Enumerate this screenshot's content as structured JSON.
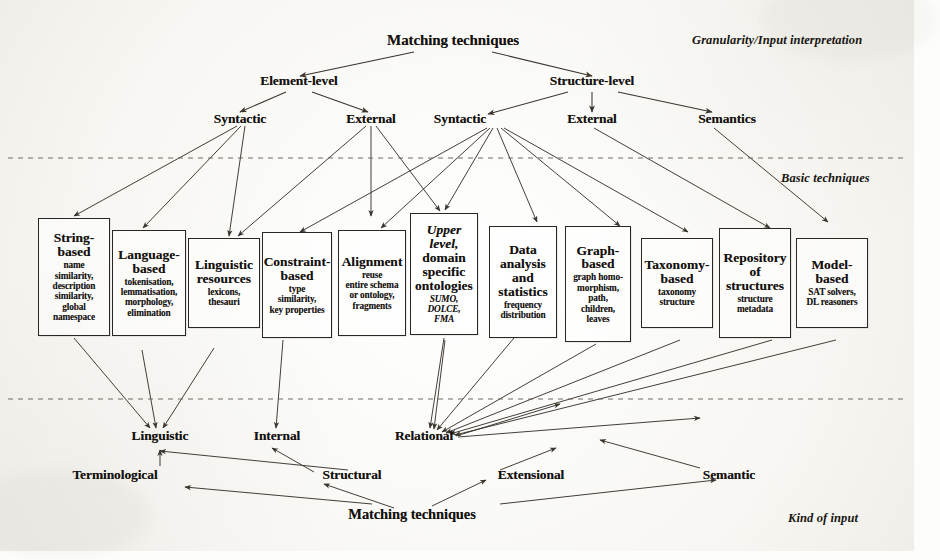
{
  "figure": {
    "root_top": "Matching techniques",
    "root_bottom": "Matching techniques",
    "tier_labels": {
      "granularity": "Granularity/Input interpretation",
      "basic": "Basic techniques",
      "kind": "Kind of input"
    },
    "level2": [
      {
        "label": "Element-level"
      },
      {
        "label": "Structure-level"
      }
    ],
    "level3": [
      {
        "label": "Syntactic"
      },
      {
        "label": "External"
      },
      {
        "label": "Syntactic"
      },
      {
        "label": "External"
      },
      {
        "label": "Semantics"
      }
    ],
    "boxes": [
      {
        "title": "String-\nbased",
        "title_italic": false,
        "sub": "name\nsimilarity,\ndescription\nsimilarity,\nglobal\nnamespace",
        "sub_italic": false
      },
      {
        "title": "Language-\nbased",
        "title_italic": false,
        "sub": "tokenisation,\nlemmatisation,\nmorphology,\nelimination",
        "sub_italic": false
      },
      {
        "title": "Linguistic\nresources",
        "title_italic": false,
        "sub": "lexicons,\nthesauri",
        "sub_italic": false
      },
      {
        "title": "Constraint-\nbased",
        "title_italic": false,
        "sub": "type\nsimilarity,\nkey properties",
        "sub_italic": false
      },
      {
        "title": "Alignment",
        "title_italic": false,
        "sub": "reuse\nentire schema\nor ontology,\nfragments",
        "sub_italic": false
      },
      {
        "title": "Upper\nlevel,",
        "title_italic": true,
        "title2": "domain\nspecific\nontologies",
        "sub": "SUMO,\nDOLCE,\nFMA",
        "sub_italic": true
      },
      {
        "title": "Data\nanalysis\nand\nstatistics",
        "title_italic": false,
        "sub": "frequency\ndistribution",
        "sub_italic": false
      },
      {
        "title": "Graph-\nbased",
        "title_italic": false,
        "sub": "graph homo-\nmorphism,\npath,\nchildren,\nleaves",
        "sub_italic": false
      },
      {
        "title": "Taxonomy-\nbased",
        "title_italic": false,
        "sub": "taxonomy\nstructure",
        "sub_italic": false
      },
      {
        "title": "Repository\nof\nstructures",
        "title_italic": false,
        "sub": "structure\nmetadata",
        "sub_italic": false
      },
      {
        "title": "Model-\nbased",
        "title_italic": false,
        "sub": "SAT solvers,\nDL reasoners",
        "sub_italic": false
      }
    ],
    "bottom_upper": [
      {
        "label": "Linguistic"
      },
      {
        "label": "Internal"
      },
      {
        "label": "Relational"
      }
    ],
    "bottom_lower": [
      {
        "label": "Terminological"
      },
      {
        "label": "Structural"
      },
      {
        "label": "Extensional"
      },
      {
        "label": "Semantic"
      }
    ],
    "colors": {
      "ink": "#14110e",
      "line": "#3a342c",
      "dashed": "#6b6156",
      "paper": "#f7f6f2"
    }
  }
}
